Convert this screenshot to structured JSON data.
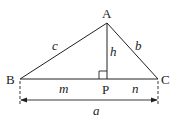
{
  "diagram": {
    "color": "#222222",
    "vertices": {
      "A": {
        "label": "A",
        "x": 107,
        "y": 23
      },
      "B": {
        "label": "B",
        "x": 20,
        "y": 79
      },
      "C": {
        "label": "C",
        "x": 158,
        "y": 79
      },
      "P": {
        "label": "P",
        "x": 107,
        "y": 79
      }
    },
    "side_labels": {
      "c": "c",
      "b": "b",
      "h": "h",
      "m": "m",
      "n": "n",
      "a": "a"
    },
    "right_angle_marker": {
      "at": "P",
      "size": 8
    },
    "dimension_line": {
      "y": 100,
      "from_x": 20,
      "to_x": 158,
      "label": "a"
    }
  }
}
